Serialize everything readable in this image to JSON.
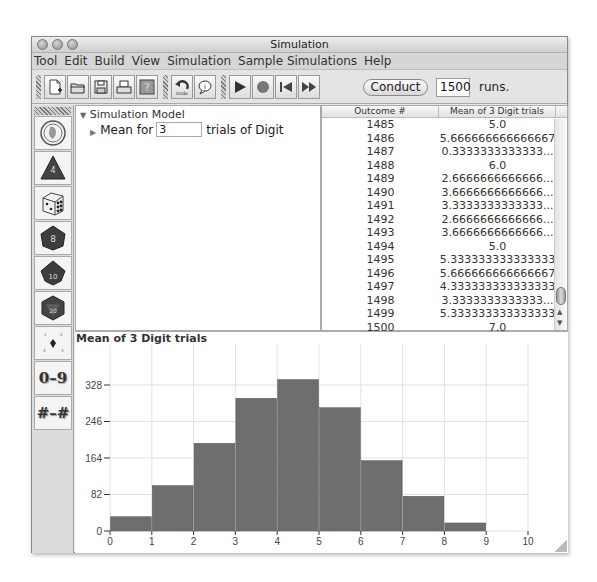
{
  "window": {
    "title": "Simulation"
  },
  "menu": [
    "Tool",
    "Edit",
    "Build",
    "View",
    "Simulation",
    "Sample Simulations",
    "Help"
  ],
  "toolbar": {
    "icons": [
      "new-document-icon",
      "open-folder-icon",
      "save-disk-icon",
      "print-icon",
      "help-icon",
      "undo-icon",
      "info-balloon-icon",
      "play-icon",
      "stop-icon",
      "rewind-icon",
      "fast-forward-icon"
    ],
    "undo_label": "Undo",
    "conduct_label": "Conduct",
    "runs_value": "1500",
    "runs_label": "runs."
  },
  "palette": {
    "items": [
      {
        "name": "coin",
        "label": ""
      },
      {
        "name": "d4",
        "label": "4"
      },
      {
        "name": "d6",
        "label": ""
      },
      {
        "name": "d8",
        "label": "8"
      },
      {
        "name": "d10",
        "label": "10"
      },
      {
        "name": "d20",
        "label": "20"
      },
      {
        "name": "spinner",
        "label": ""
      },
      {
        "name": "digit",
        "label": "0–9"
      },
      {
        "name": "range",
        "label": "#–#"
      }
    ]
  },
  "model": {
    "root_label": "Simulation Model",
    "child_prefix": "Mean for",
    "child_value": "3",
    "child_suffix": "trials of Digit"
  },
  "table": {
    "headers": [
      "Outcome #",
      "Mean of 3 Digit trials"
    ],
    "rows": [
      [
        "1485",
        "5.0"
      ],
      [
        "1486",
        "5.666666666666667"
      ],
      [
        "1487",
        "0.3333333333333..."
      ],
      [
        "1488",
        "6.0"
      ],
      [
        "1489",
        "2.6666666666666..."
      ],
      [
        "1490",
        "3.6666666666666..."
      ],
      [
        "1491",
        "3.3333333333333..."
      ],
      [
        "1492",
        "2.6666666666666..."
      ],
      [
        "1493",
        "3.6666666666666..."
      ],
      [
        "1494",
        "5.0"
      ],
      [
        "1495",
        "5.333333333333333"
      ],
      [
        "1496",
        "5.666666666666667"
      ],
      [
        "1497",
        "4.333333333333333"
      ],
      [
        "1498",
        "3.3333333333333..."
      ],
      [
        "1499",
        "5.333333333333333"
      ],
      [
        "1500",
        "7.0"
      ]
    ]
  },
  "chart_data": {
    "type": "bar",
    "title": "Mean of 3 Digit trials",
    "xlabel": "",
    "ylabel": "",
    "categories": [
      "0-1",
      "1-2",
      "2-3",
      "3-4",
      "4-5",
      "5-6",
      "6-7",
      "7-8",
      "8-9",
      "9-10"
    ],
    "values": [
      32,
      102,
      197,
      298,
      340,
      277,
      158,
      78,
      18,
      0
    ],
    "x_ticks": [
      "0",
      "1",
      "2",
      "3",
      "4",
      "5",
      "6",
      "7",
      "8",
      "9",
      "10"
    ],
    "y_ticks": [
      "0",
      "82",
      "164",
      "246",
      "328"
    ],
    "xlim": [
      0,
      10
    ],
    "ylim": [
      0,
      370
    ],
    "grid": true,
    "bar_color": "#6e6e6e"
  }
}
